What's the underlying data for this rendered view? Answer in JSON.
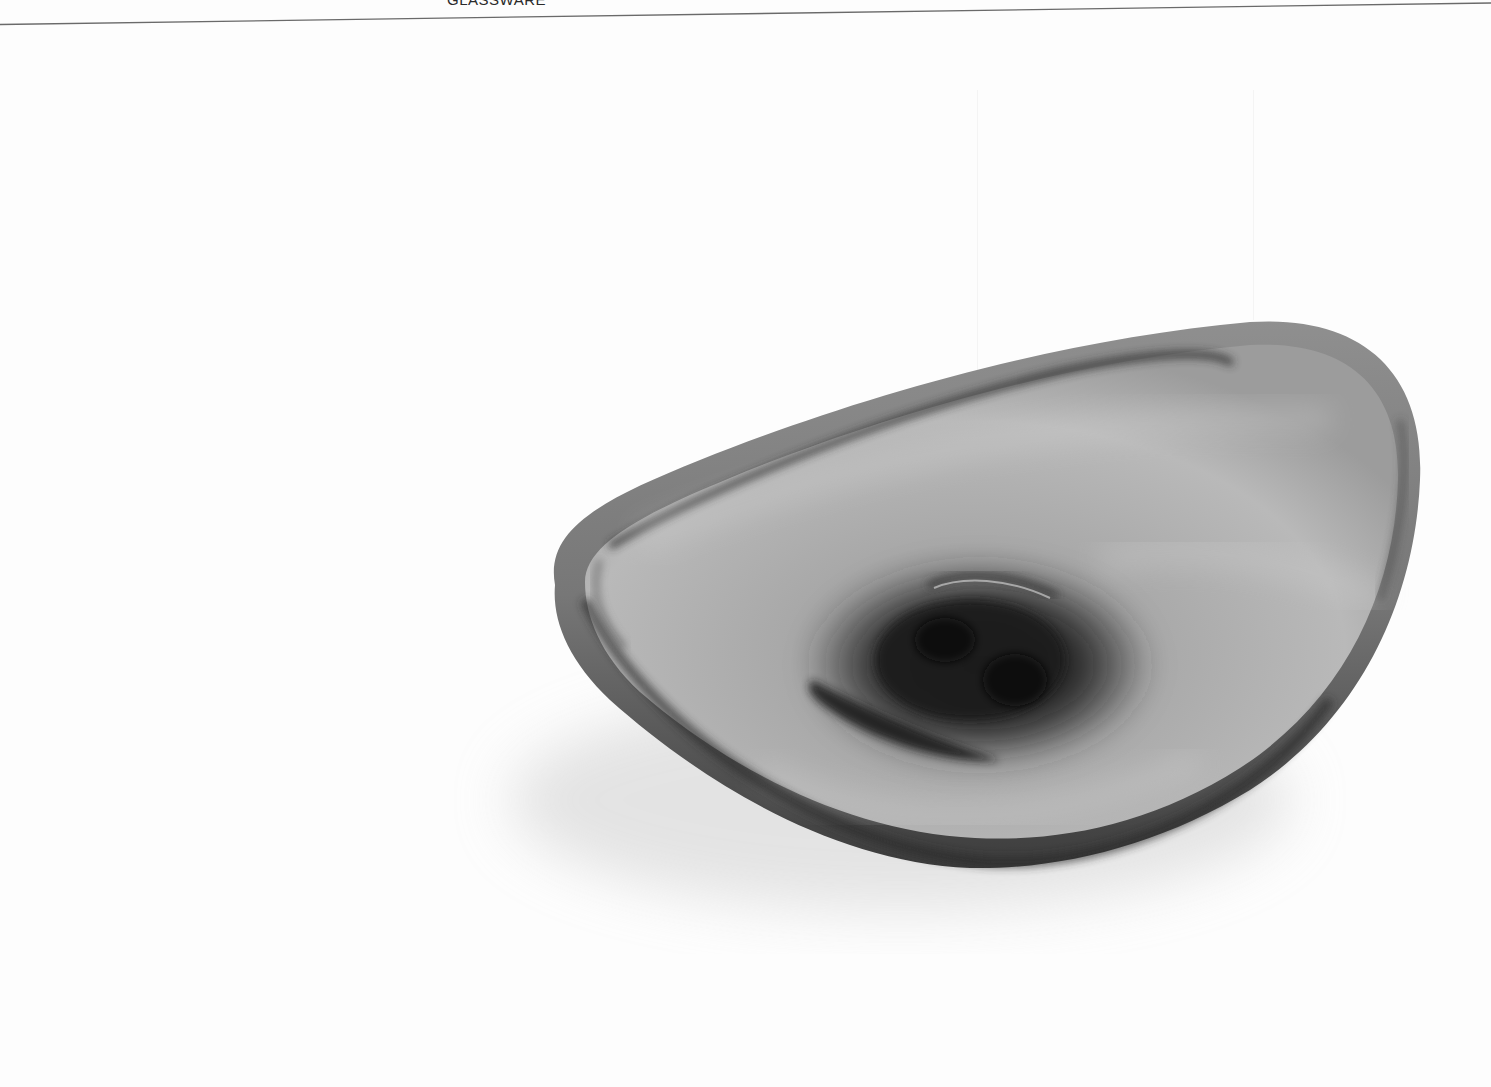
{
  "page": {
    "section_label": "GLASSWARE"
  },
  "photo": {
    "subject": "smoked grey glass bowl, asymmetric teardrop shape",
    "alt": "Grey glass bowl photographed from above at an angle",
    "colors": {
      "background": "#fdfdfd",
      "rim_dark": "#3a3a3a",
      "body_mid": "#9a9a9a",
      "body_light": "#c4c4c4",
      "center_dark": "#1a1a1a",
      "shadow": "#d8d8d8"
    }
  }
}
